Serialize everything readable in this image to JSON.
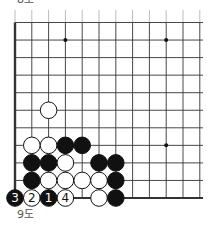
{
  "captions": {
    "top": "8도",
    "bottom": "9도"
  },
  "board": {
    "origin_x": 15,
    "origin_y": 22.5,
    "col_spacing": 16.8,
    "row_spacing": 17.55,
    "cols": 12,
    "rows": 11,
    "right_extent": 203,
    "left_edge": true,
    "bottom_edge": true,
    "line_color": "#333333",
    "stone_radius": 8.3,
    "star_points": [
      [
        3,
        1
      ],
      [
        9,
        1
      ],
      [
        9,
        7
      ]
    ],
    "stones": [
      {
        "col": 2,
        "row": 5,
        "color": "white",
        "label": ""
      },
      {
        "col": 1,
        "row": 7,
        "color": "white",
        "label": ""
      },
      {
        "col": 2,
        "row": 7,
        "color": "white",
        "label": ""
      },
      {
        "col": 3,
        "row": 7,
        "color": "black",
        "label": ""
      },
      {
        "col": 4,
        "row": 7,
        "color": "black",
        "label": ""
      },
      {
        "col": 1,
        "row": 8,
        "color": "black",
        "label": ""
      },
      {
        "col": 2,
        "row": 8,
        "color": "black",
        "label": ""
      },
      {
        "col": 3,
        "row": 8,
        "color": "white",
        "label": ""
      },
      {
        "col": 5,
        "row": 8,
        "color": "black",
        "label": ""
      },
      {
        "col": 6,
        "row": 8,
        "color": "black",
        "label": ""
      },
      {
        "col": 1,
        "row": 9,
        "color": "black",
        "label": ""
      },
      {
        "col": 2,
        "row": 9,
        "color": "white",
        "label": ""
      },
      {
        "col": 3,
        "row": 9,
        "color": "white",
        "label": ""
      },
      {
        "col": 4,
        "row": 9,
        "color": "white",
        "label": ""
      },
      {
        "col": 5,
        "row": 9,
        "color": "white",
        "label": ""
      },
      {
        "col": 6,
        "row": 9,
        "color": "black",
        "label": ""
      },
      {
        "col": 0,
        "row": 10,
        "color": "black",
        "label": "3"
      },
      {
        "col": 1,
        "row": 10,
        "color": "white",
        "label": "2"
      },
      {
        "col": 2,
        "row": 10,
        "color": "black",
        "label": "1"
      },
      {
        "col": 3,
        "row": 10,
        "color": "white",
        "label": "4"
      },
      {
        "col": 5,
        "row": 10,
        "color": "white",
        "label": ""
      },
      {
        "col": 6,
        "row": 10,
        "color": "black",
        "label": ""
      }
    ]
  }
}
